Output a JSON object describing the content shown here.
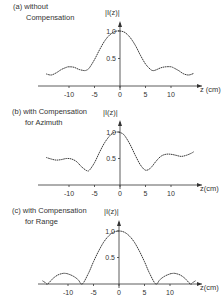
{
  "chart_data": [
    {
      "type": "line",
      "title_line1": "(a) without",
      "title_line2": "Compensation",
      "ylabel": "|I(z)|",
      "xlabel": "z (cm)",
      "xlim": [
        -15,
        15
      ],
      "ylim": [
        0,
        1.1
      ],
      "xticks": [
        -10,
        -5,
        0,
        5,
        10
      ],
      "xtick_labels": [
        "-10",
        "-5",
        "0",
        "5",
        "10"
      ],
      "yticks": [
        0.5,
        1.0
      ],
      "ytick_labels": [
        "0.5",
        "1.0"
      ],
      "grid": false,
      "x": [
        -14.5,
        -13.5,
        -12.5,
        -11.5,
        -10.5,
        -10,
        -9,
        -8,
        -7,
        -6.5,
        -6,
        -5,
        -4,
        -3,
        -2,
        -1,
        0,
        1,
        2,
        3,
        4,
        5,
        6,
        6.5,
        7,
        8,
        9,
        10,
        10.5,
        11.5,
        12.5,
        13.5,
        14.5
      ],
      "values": [
        0.22,
        0.2,
        0.24,
        0.3,
        0.34,
        0.35,
        0.34,
        0.3,
        0.28,
        0.29,
        0.33,
        0.48,
        0.66,
        0.82,
        0.93,
        0.99,
        1.0,
        0.97,
        0.88,
        0.74,
        0.56,
        0.4,
        0.3,
        0.28,
        0.29,
        0.33,
        0.35,
        0.35,
        0.33,
        0.28,
        0.22,
        0.2,
        0.23
      ]
    },
    {
      "type": "line",
      "title_line1": "(b) with Compensation",
      "title_line2": "for Azimuth",
      "ylabel": "|I(z)|",
      "xlabel": "z(cm)",
      "xlim": [
        -15,
        15
      ],
      "ylim": [
        0,
        1.1
      ],
      "xticks": [
        -10,
        -5,
        0,
        5,
        10
      ],
      "xtick_labels": [
        "-10",
        "-5",
        "0",
        "5",
        "10"
      ],
      "yticks": [
        0.5,
        1.0
      ],
      "ytick_labels": [
        "0.5",
        "1.0"
      ],
      "grid": false,
      "x": [
        -14.5,
        -13.5,
        -12.5,
        -11.5,
        -10.5,
        -9.5,
        -8.5,
        -7.5,
        -6.5,
        -6,
        -5,
        -4,
        -3,
        -2,
        -1.2,
        -0.5,
        0,
        0.5,
        1,
        2,
        3,
        4,
        5,
        6,
        7,
        8,
        9,
        10,
        11,
        12,
        13,
        14,
        14.5
      ],
      "values": [
        0.52,
        0.49,
        0.47,
        0.48,
        0.5,
        0.49,
        0.44,
        0.34,
        0.27,
        0.28,
        0.42,
        0.62,
        0.8,
        0.93,
        0.99,
        1.0,
        0.99,
        0.97,
        0.92,
        0.76,
        0.56,
        0.38,
        0.28,
        0.32,
        0.44,
        0.54,
        0.58,
        0.58,
        0.56,
        0.54,
        0.56,
        0.6,
        0.63
      ]
    },
    {
      "type": "line",
      "title_line1": "(c) with Compensation",
      "title_line2": "for Range",
      "ylabel": "|I(z)|",
      "xlabel": "z(cm)",
      "xlim": [
        -15,
        15
      ],
      "ylim": [
        0,
        1.1
      ],
      "xticks": [
        -10,
        -5,
        0,
        5,
        10
      ],
      "xtick_labels": [
        "-10",
        "-5",
        "0",
        "5",
        "10"
      ],
      "yticks": [
        0.5,
        1.0
      ],
      "ytick_labels": [
        "0.5",
        "1.0"
      ],
      "grid": false,
      "x": [
        -15,
        -14.5,
        -14,
        -13,
        -12,
        -11,
        -10.5,
        -10,
        -9,
        -8,
        -7.2,
        -6,
        -5,
        -4,
        -3,
        -2,
        -1,
        0,
        1,
        2,
        3,
        4,
        5,
        6,
        7.2,
        8,
        9,
        10,
        10.5,
        11,
        12,
        13,
        14,
        14.5,
        15
      ],
      "values": [
        0.06,
        0.03,
        0.0,
        0.1,
        0.17,
        0.2,
        0.2,
        0.19,
        0.15,
        0.08,
        0.0,
        0.2,
        0.42,
        0.62,
        0.79,
        0.91,
        0.98,
        1.0,
        0.98,
        0.91,
        0.79,
        0.62,
        0.42,
        0.2,
        0.0,
        0.08,
        0.15,
        0.19,
        0.2,
        0.2,
        0.17,
        0.1,
        0.0,
        0.03,
        0.06
      ]
    }
  ]
}
